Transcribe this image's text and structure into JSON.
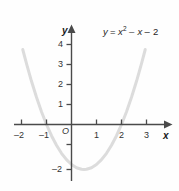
{
  "figure": {
    "background_color": "#fefefe",
    "axis_color": "#4a4a4a",
    "curve_color": "#dcdcdc",
    "text_color": "#333333",
    "origin_label": "O",
    "x_axis_name": "x",
    "y_axis_name": "y",
    "equation_parts": {
      "lhs": "y",
      "equals": "=",
      "term1_base": "x",
      "term1_exp": "2",
      "term2": "– x",
      "term3": "– 2"
    },
    "equation_text": "y = x² – x – 2"
  },
  "chart_data": {
    "type": "line",
    "title": "",
    "subtitle": "",
    "xlabel": "x",
    "ylabel": "y",
    "equation": "y = x^2 - x - 2",
    "grid": false,
    "legend": "none",
    "annotations": [
      {
        "text": "y = x² – x – 2",
        "x": 2.1,
        "y": 4.6
      }
    ],
    "xlim": [
      -2.6,
      3.8
    ],
    "ylim": [
      -2.7,
      4.9
    ],
    "x_ticks": [
      -2,
      -1,
      1,
      2,
      3
    ],
    "x_tick_labels": [
      "–2",
      "–1",
      "1",
      "2",
      "3"
    ],
    "y_ticks": [
      1,
      2,
      3,
      4,
      -1,
      -2
    ],
    "y_tick_labels_visible": [
      "1",
      "2",
      "3",
      "4",
      "–2"
    ],
    "roots": [
      -1,
      2
    ],
    "y_intercept": -2,
    "vertex": [
      0.5,
      -2.25
    ],
    "series": [
      {
        "name": "y = x^2 - x - 2",
        "color": "#dcdcdc",
        "x": [
          -1.95,
          -1.8,
          -1.6,
          -1.4,
          -1.2,
          -1.0,
          -0.8,
          -0.6,
          -0.4,
          -0.2,
          0.0,
          0.2,
          0.4,
          0.5,
          0.6,
          0.8,
          1.0,
          1.2,
          1.4,
          1.6,
          1.8,
          2.0,
          2.2,
          2.4,
          2.6,
          2.8,
          2.95
        ],
        "y": [
          3.75,
          3.04,
          2.16,
          1.36,
          0.64,
          0.0,
          -0.56,
          -1.04,
          -1.44,
          -1.76,
          -2.0,
          -2.16,
          -2.24,
          -2.25,
          -2.24,
          -2.16,
          -2.0,
          -1.76,
          -1.44,
          -1.04,
          -0.56,
          0.0,
          0.64,
          1.36,
          2.16,
          3.04,
          3.75
        ]
      }
    ]
  },
  "x_tick_labels": [
    {
      "text": "–2",
      "value": -2
    },
    {
      "text": "–1",
      "value": -1
    },
    {
      "text": "1",
      "value": 1
    },
    {
      "text": "2",
      "value": 2
    },
    {
      "text": "3",
      "value": 3
    }
  ],
  "y_tick_labels": [
    {
      "text": "4",
      "value": 4
    },
    {
      "text": "3",
      "value": 3
    },
    {
      "text": "2",
      "value": 2
    },
    {
      "text": "1",
      "value": 1
    },
    {
      "text": "–2",
      "value": -2
    }
  ]
}
